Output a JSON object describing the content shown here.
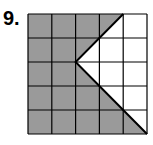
{
  "problem": {
    "number_label": "9.",
    "grid": {
      "rows": 5,
      "cols": 5
    },
    "colors": {
      "shaded": "#9a9a9a",
      "unshaded": "#ffffff",
      "lines": "#000000"
    },
    "shaded_region_description": "Grid shaded gray except a white region to the right of a V-shaped boundary",
    "boundary_vertices_grid_units": [
      [
        4,
        0
      ],
      [
        2,
        2
      ],
      [
        5,
        5
      ]
    ]
  }
}
